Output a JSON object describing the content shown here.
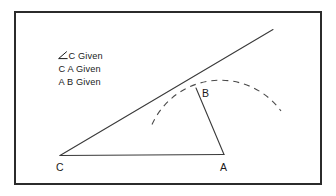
{
  "figure": {
    "frame": {
      "name": "border",
      "color": "#2b2b2b"
    },
    "given_list": {
      "items": [
        {
          "symbol": "∠",
          "text": "C Given"
        },
        {
          "symbol": "",
          "text": "C A Given"
        },
        {
          "symbol": "",
          "text": "A B Given"
        }
      ]
    },
    "vertices": [
      {
        "id": "C",
        "label": "C"
      },
      {
        "id": "A",
        "label": "A"
      },
      {
        "id": "B",
        "label": "B"
      }
    ],
    "segments": [
      {
        "name": "base-CA",
        "style": "solid"
      },
      {
        "name": "ray-C-through-B",
        "style": "solid"
      },
      {
        "name": "segment-AB",
        "style": "solid"
      }
    ],
    "arc": {
      "name": "compass-arc-centered-at-A",
      "style": "dashed",
      "center": "A",
      "radius_label": "AB"
    },
    "colors": {
      "line": "#3a3a3a",
      "text": "#1a1a1a",
      "frame": "#2b2b2b",
      "background": "#ffffff"
    }
  }
}
